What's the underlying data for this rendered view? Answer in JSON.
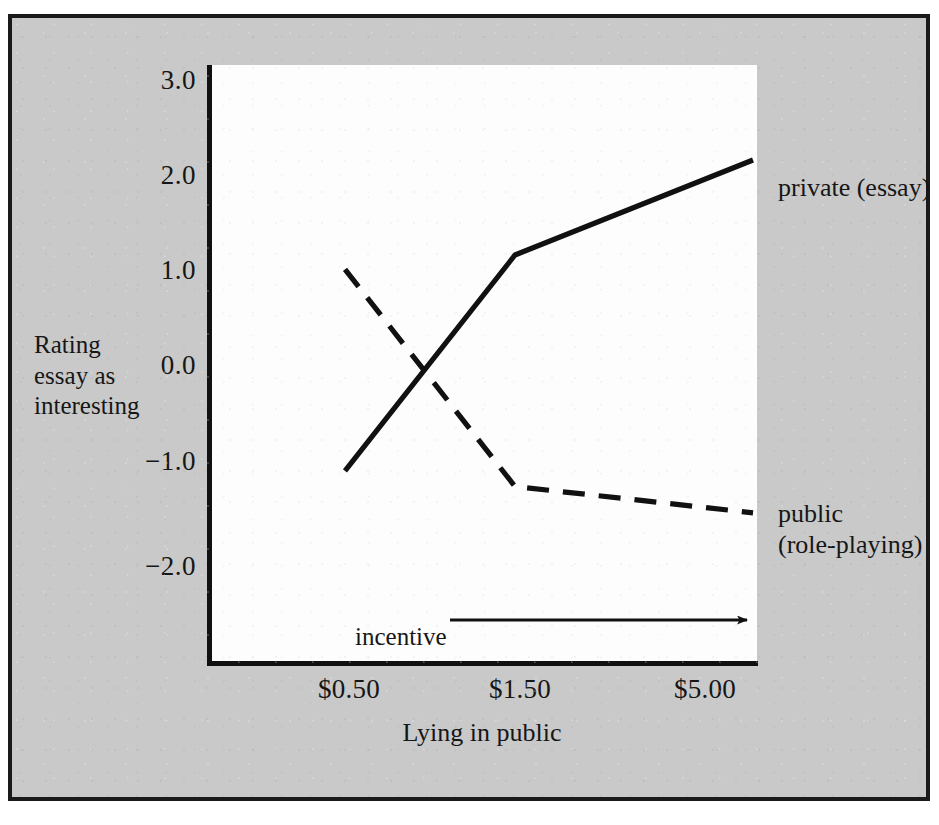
{
  "figure": {
    "xlabel": "Lying in public",
    "ylabel_lines": [
      "Rating",
      "essay as",
      "interesting"
    ],
    "incentive_label": "incentive",
    "background_color": "#c9c9c9",
    "plot_color": "#fdfdfd",
    "ink_color": "#161616"
  },
  "yticks": [
    {
      "label": "3.0",
      "value": 3.0
    },
    {
      "label": "2.0",
      "value": 2.0
    },
    {
      "label": "1.0",
      "value": 1.0
    },
    {
      "label": "0.0",
      "value": 0.0
    },
    {
      "label": "−1.0",
      "value": -1.0
    },
    {
      "label": "−2.0",
      "value": -2.0
    }
  ],
  "xticks": [
    {
      "label": "$0.50",
      "value": 0.5
    },
    {
      "label": "$1.50",
      "value": 1.5
    },
    {
      "label": "$5.00",
      "value": 5.0
    }
  ],
  "series_labels": {
    "private": "private (essay)",
    "public_line1": "public",
    "public_line2": "(role-playing)"
  },
  "chart_data": {
    "type": "line",
    "title": "",
    "xlabel": "Lying in public",
    "ylabel": "Rating essay as interesting",
    "categories": [
      "$0.50",
      "$1.50",
      "$5.00"
    ],
    "xlim": [
      0,
      2
    ],
    "ylim": [
      -2.5,
      3.2
    ],
    "grid": false,
    "legend_position": "right-inline-annotations",
    "annotations": [
      {
        "text": "incentive",
        "type": "arrow-right",
        "from_category": "$0.50",
        "to_category": "$5.00"
      }
    ],
    "series": [
      {
        "name": "private (essay)",
        "style": "solid",
        "color": "#111111",
        "values": [
          -1.15,
          1.0,
          2.0
        ]
      },
      {
        "name": "public (role-playing)",
        "style": "dashed",
        "color": "#111111",
        "values": [
          0.85,
          -1.3,
          -1.55
        ]
      }
    ]
  }
}
